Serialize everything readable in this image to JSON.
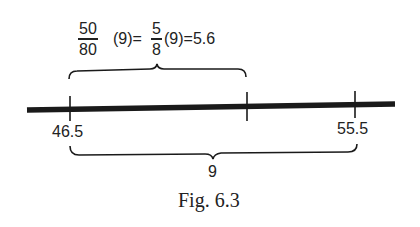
{
  "figure": {
    "caption": "Fig. 6.3",
    "equation": {
      "frac1": {
        "numerator": "50",
        "denominator": "80"
      },
      "part1": "(9)=",
      "frac2": {
        "numerator": "5",
        "denominator": "8"
      },
      "part2": "(9)=5.6"
    },
    "number_line": {
      "ticks": [
        {
          "label": "46.5",
          "position": 46.5
        },
        {
          "label": "",
          "position": 51.1
        },
        {
          "label": "55.5",
          "position": 55.5
        }
      ],
      "top_brace": {
        "span": "46.5 to 52.1",
        "value": "5.6"
      },
      "bottom_brace": {
        "span": "46.5 to 55.5",
        "label": "9"
      }
    },
    "colors": {
      "ink": "#1a1a1a",
      "background": "#ffffff"
    }
  }
}
